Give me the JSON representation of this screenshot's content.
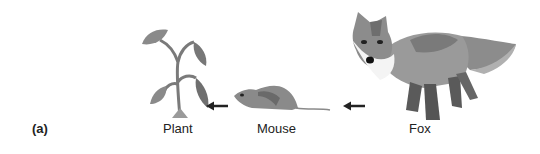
{
  "panel_label": "(a)",
  "organisms": [
    {
      "name": "Plant",
      "icon": "plant-icon"
    },
    {
      "name": "Mouse",
      "icon": "mouse-icon"
    },
    {
      "name": "Fox",
      "icon": "fox-icon"
    }
  ],
  "arrows": [
    {
      "from": "Mouse",
      "to": "Plant",
      "icon": "arrow-left-icon"
    },
    {
      "from": "Fox",
      "to": "Mouse",
      "icon": "arrow-left-icon"
    }
  ],
  "colors": {
    "ink": "#222222",
    "gray_dark": "#5a5a5a",
    "gray_mid": "#8a8a8a",
    "gray_light": "#b5b5b5"
  }
}
